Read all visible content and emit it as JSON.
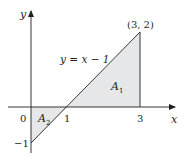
{
  "diagram": {
    "equation_label": "y = x − 1",
    "point_label": "(3, 2)",
    "axes": {
      "x_label": "x",
      "y_label": "y"
    },
    "ticks": {
      "origin": "0",
      "x_one": "1",
      "x_three": "3",
      "y_neg_one": "−1"
    },
    "regions": [
      {
        "name": "A1",
        "base": "A",
        "sub": "1"
      },
      {
        "name": "A2",
        "base": "A",
        "sub": "2"
      }
    ],
    "colors": {
      "shade": "#e6e7e8",
      "line": "#231f20"
    }
  }
}
